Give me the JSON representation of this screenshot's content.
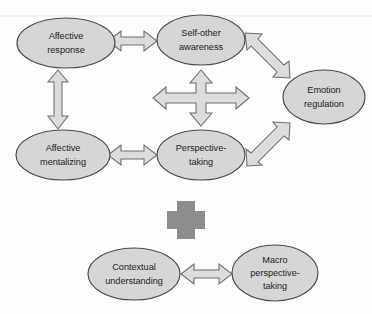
{
  "figure": {
    "type": "concept-diagram",
    "width": 372,
    "height": 314,
    "background_color": "#fdfdfd"
  },
  "style": {
    "node_fill": "#d6d6d6",
    "node_stroke": "#4a4a4a",
    "arrow_fill": "#dcdcdc",
    "arrow_stroke": "#6d6d6d",
    "plus_fill": "#8d8d8d",
    "text_color": "#1b1b1b"
  },
  "nodes": [
    {
      "id": "affective-response",
      "lines": [
        "Affective",
        "response"
      ],
      "line1": "Affective",
      "line2": "response",
      "cx": 66,
      "cy": 43,
      "rx": 49,
      "ry": 25,
      "group": "upper"
    },
    {
      "id": "self-other-awareness",
      "lines": [
        "Self-other",
        "awareness"
      ],
      "line1": "Self-other",
      "line2": "awareness",
      "cx": 201,
      "cy": 40,
      "rx": 44,
      "ry": 25,
      "group": "upper"
    },
    {
      "id": "emotion-regulation",
      "lines": [
        "Emotion",
        "regulation"
      ],
      "line1": "Emotion",
      "line2": "regulation",
      "cx": 324,
      "cy": 97,
      "rx": 41,
      "ry": 27,
      "group": "upper"
    },
    {
      "id": "affective-mentalizing",
      "lines": [
        "Affective",
        "mentalizing"
      ],
      "line1": "Affective",
      "line2": "mentalizing",
      "cx": 63,
      "cy": 155,
      "rx": 47,
      "ry": 25,
      "group": "upper"
    },
    {
      "id": "perspective-taking",
      "lines": [
        "Perspective-",
        "taking"
      ],
      "line1": "Perspective-",
      "line2": "taking",
      "cx": 201,
      "cy": 155,
      "rx": 44,
      "ry": 25,
      "group": "upper"
    },
    {
      "id": "contextual-understanding",
      "lines": [
        "Contextual",
        "understanding"
      ],
      "line1": "Contextual",
      "line2": "understanding",
      "cx": 134,
      "cy": 274,
      "rx": 46,
      "ry": 26,
      "group": "lower"
    },
    {
      "id": "macro-perspective-taking",
      "lines": [
        "Macro",
        "perspective-",
        "taking"
      ],
      "line1": "Macro",
      "line2": "perspective-",
      "line3": "taking",
      "cx": 275,
      "cy": 273,
      "rx": 43,
      "ry": 28,
      "group": "lower"
    }
  ],
  "connectors": [
    {
      "id": "affective-response--self-other-awareness",
      "from": "affective-response",
      "to": "self-other-awareness",
      "kind": "double-headed-arrow",
      "orientation": "horizontal"
    },
    {
      "id": "self-other-awareness--emotion-regulation",
      "from": "self-other-awareness",
      "to": "emotion-regulation",
      "kind": "double-headed-arrow",
      "orientation": "diagonal-down-right"
    },
    {
      "id": "affective-response--affective-mentalizing",
      "from": "affective-response",
      "to": "affective-mentalizing",
      "kind": "double-headed-arrow",
      "orientation": "vertical"
    },
    {
      "id": "affective-mentalizing--perspective-taking",
      "from": "affective-mentalizing",
      "to": "perspective-taking",
      "kind": "double-headed-arrow",
      "orientation": "horizontal"
    },
    {
      "id": "perspective-taking--emotion-regulation",
      "from": "perspective-taking",
      "to": "emotion-regulation",
      "kind": "double-headed-arrow",
      "orientation": "diagonal-up-right"
    },
    {
      "id": "central-cross",
      "from": "center",
      "to": "all",
      "kind": "four-way-cross-arrow",
      "orientation": "cross"
    },
    {
      "id": "contextual-understanding--macro-perspective-taking",
      "from": "contextual-understanding",
      "to": "macro-perspective-taking",
      "kind": "double-headed-arrow",
      "orientation": "horizontal"
    }
  ],
  "operators": [
    {
      "id": "plus-operator",
      "symbol": "plus",
      "cx": 186,
      "cy": 220,
      "joins": [
        "upper",
        "lower"
      ]
    }
  ]
}
